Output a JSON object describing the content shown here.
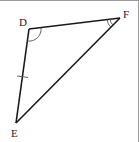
{
  "diagram": {
    "type": "triangle",
    "stroke_color": "#1a1a1a",
    "vertices": {
      "D": {
        "label": "D",
        "x": 29,
        "y": 28,
        "label_x": 19,
        "label_y": 25
      },
      "F": {
        "label": "F",
        "x": 120,
        "y": 17,
        "label_x": 123,
        "label_y": 17
      },
      "E": {
        "label": "E",
        "x": 16,
        "y": 122,
        "label_x": 11,
        "label_y": 136
      }
    },
    "markings": {
      "angle_D": "single arc",
      "angle_F": "double arc",
      "side_DE": "single tick"
    }
  }
}
